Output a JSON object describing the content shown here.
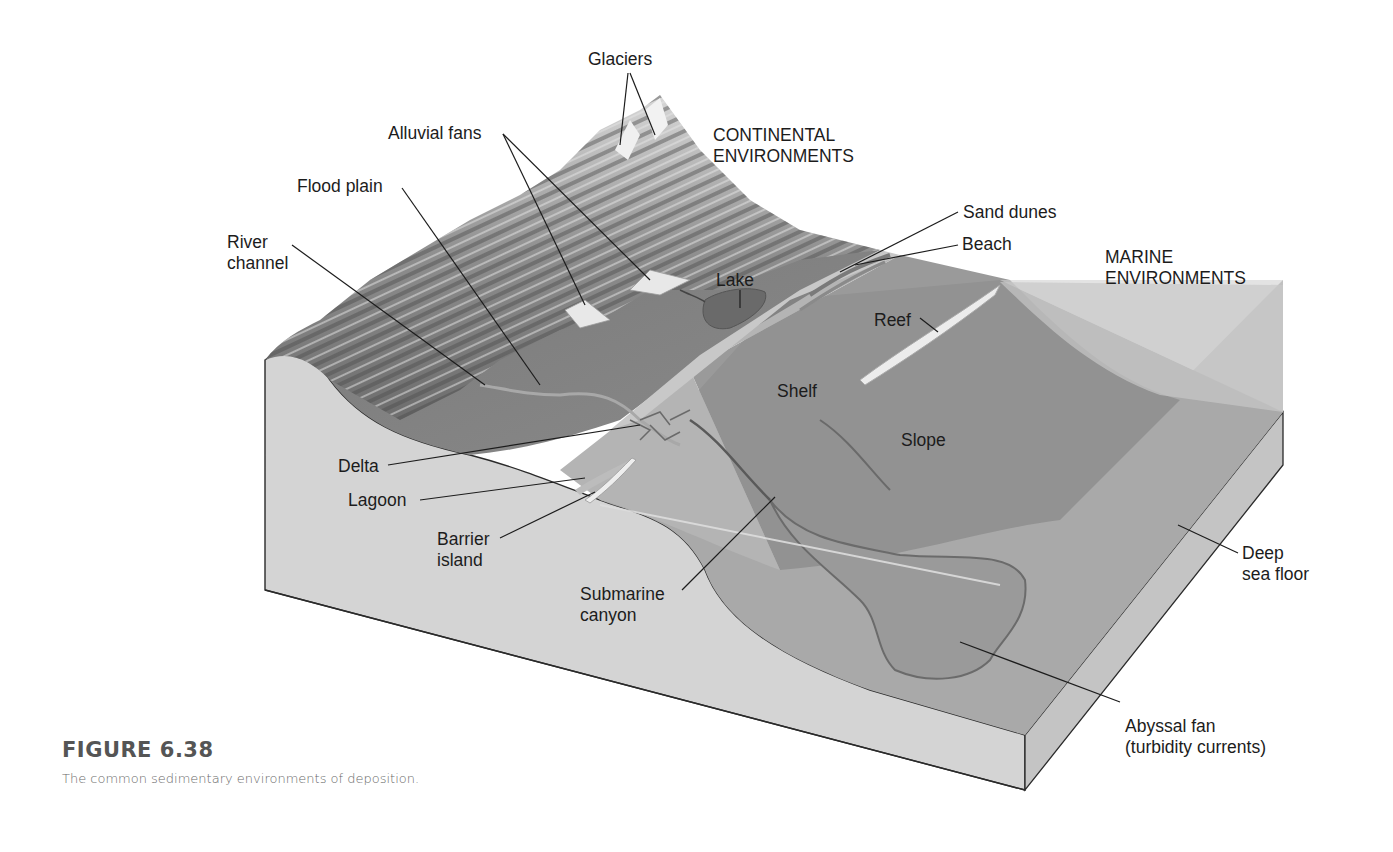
{
  "figure": {
    "title": "FIGURE 6.38",
    "caption": "The common sedimentary environments of deposition."
  },
  "headings": {
    "continental": [
      "CONTINENTAL",
      "ENVIRONMENTS"
    ],
    "marine": [
      "MARINE",
      "ENVIRONMENTS"
    ]
  },
  "labels": {
    "glaciers": [
      "Glaciers"
    ],
    "alluvial_fans": [
      "Alluvial fans"
    ],
    "flood_plain": [
      "Flood plain"
    ],
    "river_channel": [
      "River",
      "channel"
    ],
    "lake": [
      "Lake"
    ],
    "sand_dunes": [
      "Sand dunes"
    ],
    "beach": [
      "Beach"
    ],
    "reef": [
      "Reef"
    ],
    "shelf": [
      "Shelf"
    ],
    "slope": [
      "Slope"
    ],
    "delta": [
      "Delta"
    ],
    "lagoon": [
      "Lagoon"
    ],
    "barrier_island": [
      "Barrier",
      "island"
    ],
    "submarine_canyon": [
      "Submarine",
      "canyon"
    ],
    "deep_sea_floor": [
      "Deep",
      "sea floor"
    ],
    "abyssal_fan": [
      "Abyssal fan",
      "(turbidity currents)"
    ]
  },
  "colors": {
    "background": "#ffffff",
    "cross_section": "#d4d4d4",
    "land": "#7d7d7d",
    "mountain": "#9a9a9a",
    "shelf_water": "#b4b4b4",
    "slope": "#8f8f8f",
    "deep_floor": "#a6a6a6",
    "water_surface": "#c2c2c2",
    "leader_line": "#1c1c1c"
  }
}
